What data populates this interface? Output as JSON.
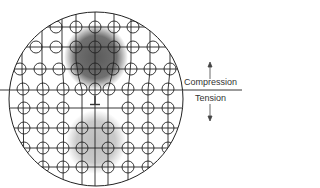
{
  "diagram": {
    "labels": {
      "compression": "Compression",
      "tension": "Tension"
    },
    "symbols": {
      "dislocation": "edge-dislocation-symbol"
    },
    "colors": {
      "lines": "#222222",
      "compression_shade": "#6e6e6e",
      "tension_shade": "#c4c4c4",
      "background": "#ffffff"
    }
  }
}
